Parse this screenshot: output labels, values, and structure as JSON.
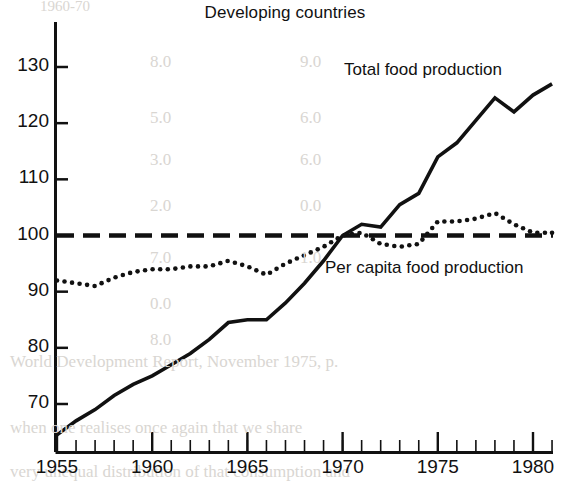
{
  "chart_data": {
    "type": "line",
    "title": "Developing countries",
    "xlabel": "",
    "ylabel": "",
    "xlim": [
      1955,
      1981
    ],
    "ylim": [
      63,
      133
    ],
    "grid": false,
    "legend_position": "inline-annotation",
    "y_ticks": [
      70,
      80,
      90,
      100,
      110,
      120,
      130
    ],
    "x_ticks": [
      1955,
      1960,
      1965,
      1970,
      1975,
      1980
    ],
    "x_minor_tick_interval": 1,
    "reference_line": {
      "value": 100,
      "style": "dashed",
      "label": ""
    },
    "x": [
      1955,
      1956,
      1957,
      1958,
      1959,
      1960,
      1961,
      1962,
      1963,
      1964,
      1965,
      1966,
      1967,
      1968,
      1969,
      1970,
      1971,
      1972,
      1973,
      1974,
      1975,
      1976,
      1977,
      1978,
      1979,
      1980,
      1981
    ],
    "series": [
      {
        "name": "Total food production",
        "style": "solid",
        "values": [
          64.5,
          67.0,
          69.0,
          71.5,
          73.5,
          75.0,
          77.0,
          79.0,
          81.5,
          84.5,
          85.0,
          85.0,
          88.0,
          91.5,
          95.5,
          100.0,
          102.0,
          101.5,
          105.5,
          107.5,
          114.0,
          116.5,
          120.5,
          124.5,
          122.0,
          125.0,
          127.0
        ]
      },
      {
        "name": "Per capita food production",
        "style": "dotted",
        "values": [
          92.0,
          91.5,
          91.0,
          92.5,
          93.5,
          94.0,
          94.0,
          94.5,
          94.5,
          95.5,
          94.5,
          93.0,
          95.0,
          96.5,
          98.0,
          100.0,
          100.5,
          98.5,
          98.0,
          98.5,
          102.5,
          102.5,
          103.0,
          104.0,
          102.0,
          100.5,
          100.5
        ]
      }
    ]
  },
  "chart": {
    "title": "Developing countries",
    "series_labels": {
      "total": "Total food production",
      "per_capita": "Per capita food production"
    },
    "y_tick_labels": [
      "130",
      "120",
      "110",
      "100",
      "90",
      "80",
      "70"
    ],
    "x_tick_labels": [
      "1955",
      "1960",
      "1965",
      "1970",
      "1975",
      "1980"
    ],
    "colors": {
      "ink": "#111111",
      "background": "#ffffff",
      "bleed_through": "#d9d6d2"
    }
  },
  "bleed_through": {
    "note": "faint reverse-side page text visible through the paper",
    "lines": [
      "1960-70",
      "8.0",
      "9.0",
      "5.0",
      "6.0",
      "3.0",
      "6.0",
      "2.0",
      "0.0",
      "7.0",
      "1.0",
      "0.0",
      "8.0",
      "3.0",
      "World Development Report, November 1975, p.",
      "when one realises once again that we share",
      "very unequal distribution of that consumption and"
    ]
  }
}
